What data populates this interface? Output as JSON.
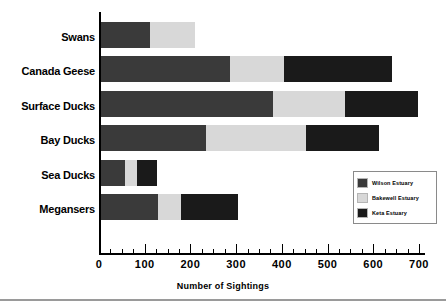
{
  "chart_data": {
    "type": "bar",
    "orientation": "horizontal",
    "stacked": true,
    "title": "",
    "xlabel": "Number of Sightings",
    "ylabel": "",
    "xlim": [
      0,
      700
    ],
    "xticks": [
      0,
      100,
      200,
      300,
      400,
      500,
      600,
      700
    ],
    "xtick_labels": [
      "0",
      "100",
      "200",
      "300",
      "400",
      "500",
      "600",
      "700"
    ],
    "minor_tick_interval": 25,
    "grid": false,
    "legend_position": "center-right",
    "categories": [
      "Swans",
      "Canada Geese",
      "Surface Ducks",
      "Bay Ducks",
      "Sea Ducks",
      "Megansers"
    ],
    "series": [
      {
        "name": "Wilson Estuary",
        "color": "#3a3a3a",
        "values": [
          110,
          285,
          378,
          232,
          54,
          127
        ]
      },
      {
        "name": "Bakewell Estuary",
        "color": "#d8d8d8",
        "values": [
          97,
          117,
          159,
          219,
          26,
          51
        ]
      },
      {
        "name": "Keta Estuary",
        "color": "#1a1a1a",
        "values": [
          0,
          237,
          158,
          159,
          44,
          124
        ]
      }
    ],
    "totals": [
      207,
      639,
      695,
      610,
      124,
      302
    ]
  },
  "legend": {
    "entries": [
      {
        "label": "Wilson Estuary",
        "swatch": "wilson"
      },
      {
        "label": "Bakewell Estuary",
        "swatch": "bakewell"
      },
      {
        "label": "Keta Estuary",
        "swatch": "keta"
      }
    ]
  },
  "colors": {
    "wilson": "#3a3a3a",
    "bakewell": "#d8d8d8",
    "keta": "#1a1a1a",
    "axis": "#000000",
    "background": "#ffffff"
  }
}
